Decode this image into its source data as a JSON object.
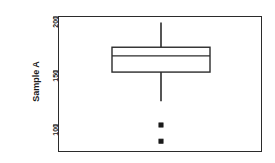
{
  "chart_data": {
    "type": "box",
    "title": "",
    "xlabel": "",
    "ylabel": "Sample A",
    "ylim": [
      80,
      202
    ],
    "grid": false,
    "legend": null,
    "y_ticks": [
      {
        "value": 200,
        "label": "200"
      },
      {
        "value": 150,
        "label": "150"
      },
      {
        "value": 100,
        "label": "100"
      }
    ],
    "x_ticks": [],
    "categories": [
      "Sample A"
    ],
    "series": [
      {
        "name": "Sample A",
        "whisker_low": 122,
        "q1": 149,
        "median": 164,
        "q3": 172,
        "whisker_high": 195,
        "outliers": [
          100,
          85
        ]
      }
    ],
    "marker": "filled-square",
    "box_fill": "#ffffff",
    "line_color": "#1a1a1a",
    "background": "#ffffff"
  },
  "axes": {
    "y_title": "Sample A",
    "tick_200": "200",
    "tick_150": "150",
    "tick_100": "100"
  }
}
